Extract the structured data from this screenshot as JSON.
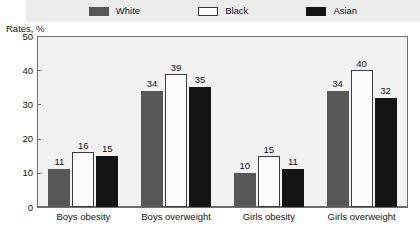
{
  "chart_data": {
    "type": "bar",
    "title": "",
    "xlabel": "",
    "ylabel": "Rates, %",
    "ylim": [
      0,
      50
    ],
    "yticks": [
      0,
      10,
      20,
      30,
      40,
      50
    ],
    "grid": false,
    "legend_position": "top-center",
    "categories": [
      "Boys obesity",
      "Boys overweight",
      "Girls obesity",
      "Girls overweight"
    ],
    "series": [
      {
        "name": "White",
        "color": "#575757",
        "values": [
          11,
          34,
          10,
          34
        ]
      },
      {
        "name": "Black",
        "color": "#fbfbfb",
        "values": [
          16,
          39,
          15,
          40
        ]
      },
      {
        "name": "Asian",
        "color": "#141414",
        "values": [
          15,
          35,
          11,
          32
        ]
      }
    ]
  },
  "legend": {
    "items": [
      {
        "label": "White",
        "swatch": "swatch-white-series"
      },
      {
        "label": "Black",
        "swatch": "swatch-black-series"
      },
      {
        "label": "Asian",
        "swatch": "swatch-asian-series"
      }
    ]
  },
  "axis": {
    "y_title": "Rates, %",
    "y_tick_labels": [
      "50",
      "40",
      "30",
      "20",
      "10",
      "0"
    ]
  },
  "colors": {
    "white_series": "#575757",
    "black_series": "#fbfbfb",
    "asian_series": "#141414",
    "plot_background": "#f2f2f2",
    "legend_background": "#ededed",
    "axis_line": "#6e6e6e",
    "text": "#141414"
  }
}
